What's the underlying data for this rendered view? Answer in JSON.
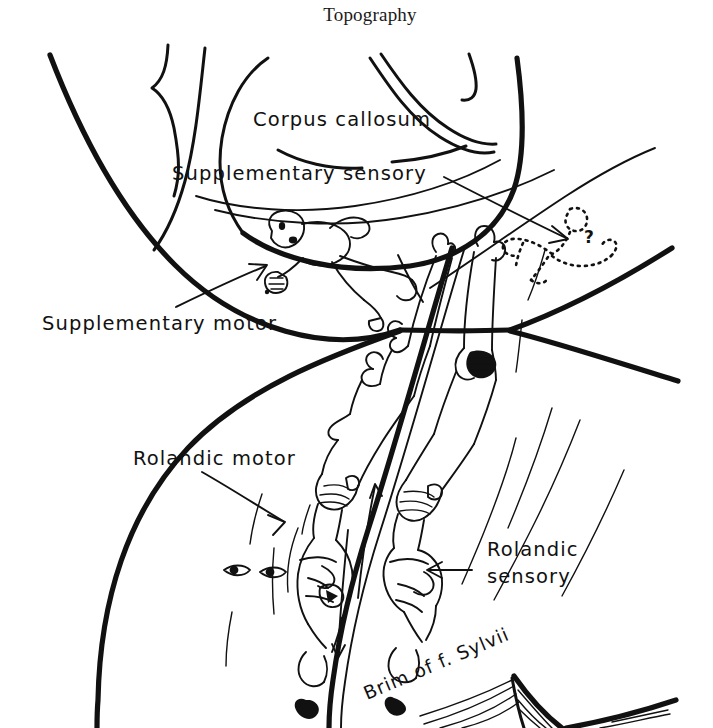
{
  "figure": {
    "title": "Topography",
    "title_x": 370,
    "title_y": 21,
    "width": 713,
    "height": 728,
    "background_color": "#ffffff",
    "ink_color": "#111111",
    "style": "hand-drawn neuroanatomical line diagram"
  },
  "labels": {
    "corpus_callosum": "Corpus callosum",
    "supplementary_sensory": "Supplementary sensory",
    "supplementary_motor": "Supplementary motor",
    "rolandic_motor": "Rolandic motor",
    "rolandic_sensory_line1": "Rolandic",
    "rolandic_sensory_line2": "sensory",
    "brim_of_fissure_sylvii": "Brim of f. Sylvii",
    "question_mark": "?"
  },
  "label_positions": {
    "corpus_callosum": {
      "x": 253,
      "y": 126
    },
    "supplementary_sensory": {
      "x": 172,
      "y": 180
    },
    "supplementary_motor": {
      "x": 42,
      "y": 330
    },
    "rolandic_motor": {
      "x": 133,
      "y": 465
    },
    "rolandic_sensory_line1": {
      "x": 487,
      "y": 556
    },
    "rolandic_sensory_line2": {
      "x": 487,
      "y": 583
    },
    "brim_of_fissure_sylvii": {
      "x": 367,
      "y": 700,
      "rotation_deg": -23
    },
    "question_mark": {
      "x": 589,
      "y": 237
    }
  },
  "annotations": [
    {
      "name": "supplementary-sensory-arrow",
      "from_x": 444,
      "from_y": 177,
      "to_x": 566,
      "to_y": 238,
      "direction": "down-right"
    },
    {
      "name": "supplementary-motor-arrow",
      "from_x": 176,
      "from_y": 307,
      "to_x": 266,
      "to_y": 266,
      "direction": "up-right"
    },
    {
      "name": "rolandic-motor-arrow",
      "from_x": 202,
      "from_y": 472,
      "to_x": 283,
      "to_y": 521,
      "direction": "down-right"
    },
    {
      "name": "rolandic-sensory-arrow",
      "from_x": 472,
      "from_y": 570,
      "to_x": 428,
      "to_y": 570,
      "direction": "left"
    }
  ],
  "anatomy_features": [
    {
      "name": "outer-hemisphere-contour",
      "description": "thick medial surface outline of cerebral hemisphere"
    },
    {
      "name": "corpus-callosum-body",
      "description": "arched double contour of the corpus callosum"
    },
    {
      "name": "cingulate-sulcus",
      "description": "curved sulcus line above corpus callosum"
    },
    {
      "name": "supplementary-motor-homunculus",
      "description": "small figure lying on medial frontal surface"
    },
    {
      "name": "supplementary-sensory-homunculus",
      "description": "dotted outline figure with question mark"
    },
    {
      "name": "rolandic-motor-homunculus",
      "description": "elongated figure along precentral gyrus"
    },
    {
      "name": "rolandic-sensory-homunculus",
      "description": "elongated figure along postcentral gyrus"
    },
    {
      "name": "central-sulcus",
      "description": "thick line between motor and sensory strips with arrows"
    },
    {
      "name": "sylvian-fissure-brim",
      "description": "hatched wedge at inferior margin"
    }
  ]
}
